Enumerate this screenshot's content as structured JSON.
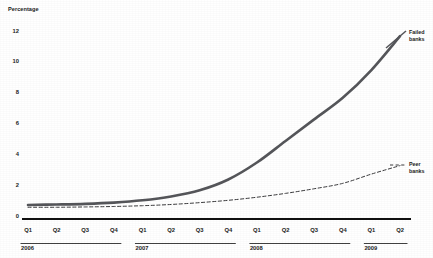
{
  "chart_data": {
    "type": "line",
    "title": "",
    "xlabel": "",
    "ylabel": "Percentage",
    "ylim": [
      0,
      12.6
    ],
    "yticks": [
      0,
      2,
      4,
      6,
      8,
      10,
      12
    ],
    "grid": false,
    "legend_position": "right-inline",
    "categories": [
      "2006 Q1",
      "2006 Q2",
      "2006 Q3",
      "2006 Q4",
      "2007 Q1",
      "2007 Q2",
      "2007 Q3",
      "2007 Q4",
      "2008 Q1",
      "2008 Q2",
      "2008 Q3",
      "2008 Q4",
      "2009 Q1",
      "2009 Q2"
    ],
    "quarter_labels": [
      "Q1",
      "Q2",
      "Q3",
      "Q4",
      "Q1",
      "Q2",
      "Q3",
      "Q4",
      "Q1",
      "Q2",
      "Q3",
      "Q4",
      "Q1",
      "Q2"
    ],
    "year_groups": [
      {
        "year": "2006",
        "quarters": [
          "Q1",
          "Q2",
          "Q3",
          "Q4"
        ]
      },
      {
        "year": "2007",
        "quarters": [
          "Q1",
          "Q2",
          "Q3",
          "Q4"
        ]
      },
      {
        "year": "2008",
        "quarters": [
          "Q1",
          "Q2",
          "Q3",
          "Q4"
        ]
      },
      {
        "year": "2009",
        "quarters": [
          "Q1",
          "Q2"
        ]
      }
    ],
    "series": [
      {
        "name": "Failed banks",
        "style": "solid",
        "color": "#55565a",
        "width": 2.6,
        "values": [
          0.75,
          0.78,
          0.82,
          0.9,
          1.05,
          1.3,
          1.7,
          2.4,
          3.5,
          4.9,
          6.3,
          7.7,
          9.5,
          11.7
        ]
      },
      {
        "name": "Peer banks",
        "style": "dashed",
        "color": "#3a3a3c",
        "width": 1.0,
        "values": [
          0.6,
          0.6,
          0.62,
          0.65,
          0.7,
          0.78,
          0.9,
          1.05,
          1.25,
          1.5,
          1.8,
          2.15,
          2.75,
          3.3
        ]
      }
    ]
  },
  "labels": {
    "y_axis_title": "Percentage",
    "series_failed": {
      "line1": "Failed",
      "line2": "banks"
    },
    "series_peer": {
      "line1": "Peer",
      "line2": "banks"
    }
  }
}
